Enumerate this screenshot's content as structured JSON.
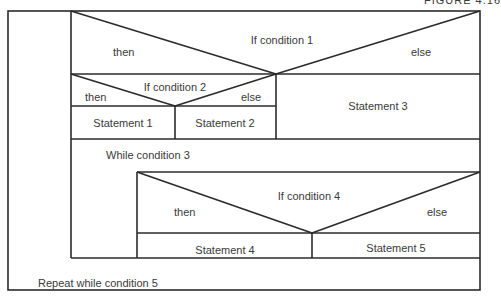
{
  "figure_label": "FIGURE 4.16",
  "diagram": {
    "type": "Nassi-Shneiderman structured flowchart",
    "if1": {
      "condition": "If condition 1",
      "then": "then",
      "else": "else"
    },
    "if2": {
      "condition": "If condition 2",
      "then": "then",
      "else": "else"
    },
    "statements": {
      "s1": "Statement 1",
      "s2": "Statement 2",
      "s3": "Statement 3",
      "s4": "Statement 4",
      "s5": "Statement 5"
    },
    "while3": "While condition 3",
    "if4": {
      "condition": "If condition 4",
      "then": "then",
      "else": "else"
    },
    "repeat5": "Repeat while condition 5"
  },
  "colors": {
    "line": "#2b2b2b",
    "text": "#3a3a3a",
    "background": "#ffffff"
  }
}
